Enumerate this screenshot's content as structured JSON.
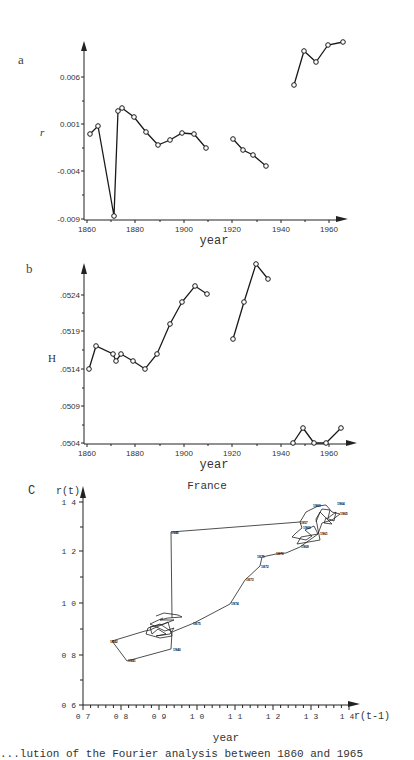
{
  "chart_data": [
    {
      "panel": "a",
      "type": "line",
      "title": "",
      "xlabel": "year",
      "ylabel": "r",
      "xlim": [
        1860,
        1967
      ],
      "ylim": [
        -0.009,
        0.0105
      ],
      "x_ticks": [
        "1860",
        "1880",
        "1900",
        "1920",
        "1940",
        "1960"
      ],
      "y_ticks": [
        "0.006",
        "0.001",
        "-0.004",
        "-0.009"
      ],
      "marker": "open-circle",
      "series": [
        {
          "name": "segment-1",
          "x": [
            1861,
            1864,
            1871,
            1873,
            1875,
            1880,
            1885,
            1890,
            1895,
            1900,
            1905,
            1910
          ],
          "y": [
            0.0,
            0.0008,
            -0.0089,
            0.0018,
            0.0021,
            0.0011,
            -0.0004,
            -0.0018,
            -0.0012,
            -0.0005,
            -0.0006,
            -0.002
          ]
        },
        {
          "name": "segment-2",
          "x": [
            1920,
            1925,
            1930,
            1935
          ],
          "y": [
            -0.0012,
            -0.0023,
            -0.0029,
            -0.0041
          ]
        },
        {
          "name": "segment-3",
          "x": [
            1946,
            1950,
            1955,
            1960,
            1965
          ],
          "y": [
            0.0051,
            0.0087,
            0.0076,
            0.0093,
            0.0097
          ]
        }
      ]
    },
    {
      "panel": "b",
      "type": "line",
      "title": "",
      "xlabel": "year",
      "ylabel": "H",
      "xlim": [
        1860,
        1967
      ],
      "ylim": [
        0.0504,
        0.053
      ],
      "x_ticks": [
        "1860",
        "1880",
        "1900",
        "1920",
        "1940",
        "1960"
      ],
      "y_ticks": [
        ".0524",
        ".0519",
        ".0514",
        ".0509",
        ".0504"
      ],
      "marker": "open-circle",
      "series": [
        {
          "name": "segment-1",
          "x": [
            1861,
            1864,
            1871,
            1872,
            1874,
            1879,
            1884,
            1890,
            1895,
            1900,
            1905,
            1910
          ],
          "y": [
            0.0514,
            0.05171,
            0.05161,
            0.05151,
            0.05161,
            0.05151,
            0.0514,
            0.05161,
            0.05201,
            0.05231,
            0.05252,
            0.05241
          ]
        },
        {
          "name": "segment-2",
          "x": [
            1921,
            1925,
            1930,
            1935
          ],
          "y": [
            0.05181,
            0.05231,
            0.05281,
            0.05261
          ]
        },
        {
          "name": "segment-3",
          "x": [
            1945,
            1949,
            1954,
            1959,
            1965
          ],
          "y": [
            0.0504,
            0.0506,
            0.0504,
            0.0504,
            0.0506
          ]
        }
      ]
    },
    {
      "panel": "c",
      "type": "line",
      "title": "France",
      "xlabel": "r(t-1)",
      "ylabel": "r(t)",
      "bottom_label": "year",
      "xlim": [
        0.7,
        1.42
      ],
      "ylim": [
        0.6,
        1.42
      ],
      "x_ticks": [
        "0.7",
        "0.8",
        "0.9",
        "1.0",
        "1.1",
        "1.2",
        "1.3",
        "1.4"
      ],
      "y_ticks": [
        "1.4",
        "1.2",
        "1.0",
        "0.8",
        "0.6"
      ],
      "description": "Phase-space trajectory r(t) vs r(t-1), each point labeled with its year",
      "series": [
        {
          "name": "trajectory",
          "x": [
            0.93,
            0.92,
            0.88,
            0.87,
            0.9,
            0.93,
            0.89,
            0.78,
            0.82,
            0.94,
            0.92,
            0.95,
            0.93,
            1.0,
            1.1,
            1.13,
            1.16,
            1.19,
            1.17,
            1.21,
            1.26,
            1.3,
            1.26,
            1.27,
            1.25,
            1.3,
            1.32,
            1.36,
            1.37,
            1.33,
            1.32,
            1.29,
            0.94
          ],
          "y": [
            0.92,
            0.94,
            0.9,
            0.88,
            0.87,
            0.88,
            0.9,
            0.85,
            0.78,
            0.83,
            0.88,
            0.93,
            0.94,
            0.92,
            1.0,
            1.1,
            1.14,
            1.17,
            1.18,
            1.2,
            1.22,
            1.26,
            1.25,
            1.28,
            1.3,
            1.34,
            1.37,
            1.37,
            1.34,
            1.32,
            1.33,
            1.31,
            1.27
          ],
          "labels": [
            "",
            "",
            "",
            "",
            "",
            "",
            "",
            "1942",
            "1941",
            "1940",
            "",
            "",
            "",
            "1875",
            "1874",
            "1873",
            "1872",
            "1871",
            "",
            "1870",
            "1869",
            "1961",
            "",
            "1960",
            "1959",
            "1962",
            "1963",
            "1964",
            "1965",
            "",
            "",
            "1957",
            "1946"
          ]
        }
      ]
    }
  ],
  "panels": {
    "a": {
      "letter": "a",
      "ylabel": "r",
      "xlabel": "year"
    },
    "b": {
      "letter": "b",
      "ylabel": "H",
      "xlabel": "year"
    },
    "c": {
      "letter": "c",
      "title": "France",
      "ylabel": "r(t)",
      "xlabel": "r(t-1)",
      "bottom_label": "year"
    }
  },
  "ticks": {
    "years": [
      "1860",
      "1880",
      "1900",
      "1920",
      "1940",
      "1960"
    ],
    "a_y": [
      "0.006",
      "0.001",
      "-0.004",
      "-0.009"
    ],
    "b_y": [
      ".0524",
      ".0519",
      ".0514",
      ".0509",
      ".0504"
    ],
    "c_x": [
      "0 7",
      "0 8",
      "0 9",
      "1 0",
      "1 1",
      "1 2",
      "1 3",
      "1 4"
    ],
    "c_y": [
      "1 4",
      "1 2",
      "1 0",
      "0 8",
      "0 6"
    ]
  },
  "caption": "...lution of the Fourier analysis between 1860 and 1965"
}
